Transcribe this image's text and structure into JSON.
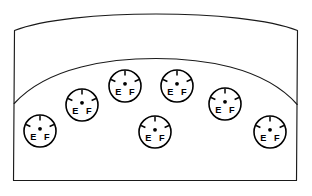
{
  "diagram": {
    "type": "line-art-schematic",
    "stroke_color": "#1a1a1a",
    "gauge_stroke_color": "#000000",
    "background_color": "#ffffff",
    "canvas": {
      "width": 312,
      "height": 196
    }
  },
  "panel": {
    "name": "console-panel",
    "description": "Curved-top console housing",
    "top_edge": "convex-arc",
    "bottom_edge": "straight",
    "shelf_arc": "convex-arc"
  },
  "gauge_template": {
    "left_label": "E",
    "right_label": "F",
    "radius": 16,
    "tick_count": 3,
    "tick_angles_deg": [
      -90,
      -155,
      -25
    ],
    "hub": "center-dot"
  },
  "gauges": [
    {
      "id": "gauge-1",
      "label": "E",
      "label_right": "F",
      "cx": 40,
      "cy": 131,
      "r": 16
    },
    {
      "id": "gauge-2",
      "label": "E",
      "label_right": "F",
      "cx": 82,
      "cy": 105,
      "r": 16
    },
    {
      "id": "gauge-3",
      "label": "E",
      "label_right": "F",
      "cx": 125,
      "cy": 86,
      "r": 16
    },
    {
      "id": "gauge-4",
      "label": "E",
      "label_right": "F",
      "cx": 177,
      "cy": 86,
      "r": 16
    },
    {
      "id": "gauge-5",
      "label": "E",
      "label_right": "F",
      "cx": 225,
      "cy": 104,
      "r": 16
    },
    {
      "id": "gauge-6",
      "label": "E",
      "label_right": "F",
      "cx": 270,
      "cy": 132,
      "r": 16
    },
    {
      "id": "gauge-7",
      "label": "E",
      "label_right": "F",
      "cx": 155,
      "cy": 132,
      "r": 16
    }
  ],
  "counts": {
    "gauge_total": 7
  }
}
